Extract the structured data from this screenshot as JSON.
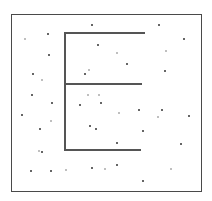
{
  "image": {
    "width": 212,
    "height": 201,
    "background": "#ffffff"
  },
  "frame": {
    "left": 11,
    "top": 14,
    "right": 202,
    "bottom": 192,
    "color": "#4a4a4a"
  },
  "glyph": {
    "letter": "E",
    "color": "#555555",
    "strokes": [
      {
        "name": "vertical-stem",
        "x": 64,
        "y": 32,
        "w": 2,
        "h": 119
      },
      {
        "name": "top-bar",
        "x": 64,
        "y": 32,
        "w": 81,
        "h": 2
      },
      {
        "name": "middle-bar",
        "x": 64,
        "y": 83,
        "w": 78,
        "h": 2
      },
      {
        "name": "bottom-bar",
        "x": 64,
        "y": 149,
        "w": 77,
        "h": 2
      }
    ]
  },
  "noise_dots": [
    {
      "x": 47,
      "y": 33,
      "c": "#333"
    },
    {
      "x": 91,
      "y": 24,
      "c": "#333"
    },
    {
      "x": 158,
      "y": 24,
      "c": "#333"
    },
    {
      "x": 183,
      "y": 38,
      "c": "#333"
    },
    {
      "x": 97,
      "y": 44,
      "c": "#333"
    },
    {
      "x": 24,
      "y": 38,
      "c": "#aaa"
    },
    {
      "x": 48,
      "y": 54,
      "c": "#333"
    },
    {
      "x": 116,
      "y": 52,
      "c": "#aaa"
    },
    {
      "x": 165,
      "y": 50,
      "c": "#aaa"
    },
    {
      "x": 126,
      "y": 63,
      "c": "#333"
    },
    {
      "x": 164,
      "y": 70,
      "c": "#333"
    },
    {
      "x": 32,
      "y": 73,
      "c": "#333"
    },
    {
      "x": 41,
      "y": 79,
      "c": "#aaa"
    },
    {
      "x": 84,
      "y": 73,
      "c": "#333"
    },
    {
      "x": 88,
      "y": 69,
      "c": "#aaa"
    },
    {
      "x": 31,
      "y": 94,
      "c": "#333"
    },
    {
      "x": 87,
      "y": 94,
      "c": "#aaa"
    },
    {
      "x": 98,
      "y": 94,
      "c": "#aaa"
    },
    {
      "x": 51,
      "y": 102,
      "c": "#333"
    },
    {
      "x": 21,
      "y": 114,
      "c": "#333"
    },
    {
      "x": 79,
      "y": 104,
      "c": "#333"
    },
    {
      "x": 100,
      "y": 102,
      "c": "#333"
    },
    {
      "x": 118,
      "y": 112,
      "c": "#aaa"
    },
    {
      "x": 138,
      "y": 109,
      "c": "#333"
    },
    {
      "x": 161,
      "y": 109,
      "c": "#333"
    },
    {
      "x": 188,
      "y": 115,
      "c": "#333"
    },
    {
      "x": 157,
      "y": 116,
      "c": "#aaa"
    },
    {
      "x": 39,
      "y": 128,
      "c": "#333"
    },
    {
      "x": 50,
      "y": 120,
      "c": "#aaa"
    },
    {
      "x": 89,
      "y": 125,
      "c": "#333"
    },
    {
      "x": 95,
      "y": 128,
      "c": "#333"
    },
    {
      "x": 142,
      "y": 130,
      "c": "#333"
    },
    {
      "x": 180,
      "y": 143,
      "c": "#333"
    },
    {
      "x": 116,
      "y": 142,
      "c": "#333"
    },
    {
      "x": 41,
      "y": 151,
      "c": "#333"
    },
    {
      "x": 38,
      "y": 150,
      "c": "#aaa"
    },
    {
      "x": 116,
      "y": 164,
      "c": "#333"
    },
    {
      "x": 30,
      "y": 170,
      "c": "#333"
    },
    {
      "x": 50,
      "y": 170,
      "c": "#333"
    },
    {
      "x": 65,
      "y": 169,
      "c": "#aaa"
    },
    {
      "x": 91,
      "y": 167,
      "c": "#333"
    },
    {
      "x": 104,
      "y": 168,
      "c": "#aaa"
    },
    {
      "x": 170,
      "y": 168,
      "c": "#aaa"
    },
    {
      "x": 142,
      "y": 180,
      "c": "#333"
    }
  ]
}
